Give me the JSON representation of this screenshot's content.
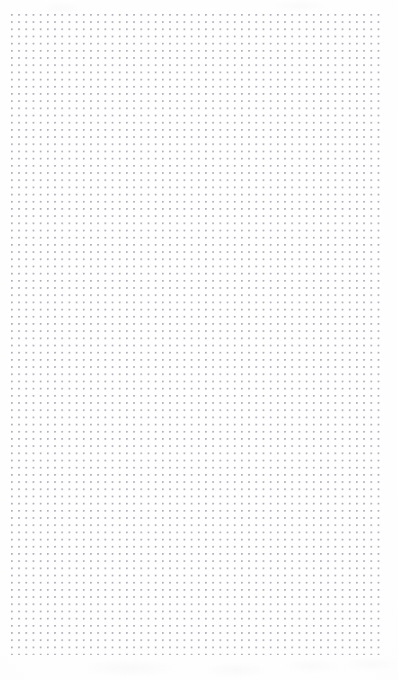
{
  "page": {
    "kind": "dot-grid-paper",
    "width_px": 398,
    "height_px": 680,
    "background_color": "#fefefe",
    "text_content": "",
    "has_text": false,
    "has_rules": false,
    "has_headers": false
  },
  "grid": {
    "type": "dot",
    "dot_color": "#b8b8c0",
    "dot_diameter_px": 1.3,
    "spacing_x_px": 7.2,
    "spacing_y_px": 7.2,
    "origin_x_px": 11,
    "origin_y_px": 14,
    "columns": 52,
    "rows": 90,
    "margin_left_px": 11,
    "margin_top_px": 14,
    "margin_right_px": 15,
    "margin_bottom_px": 25
  }
}
